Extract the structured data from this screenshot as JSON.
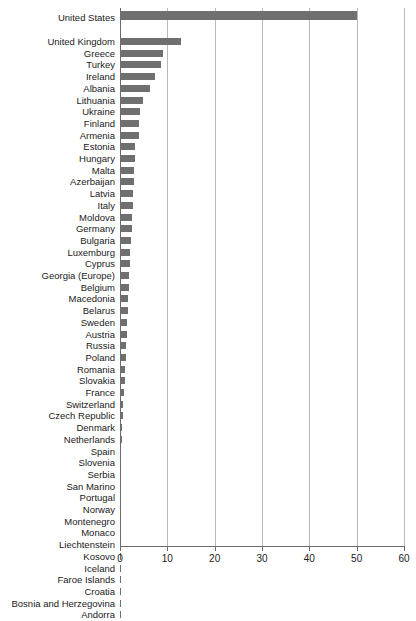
{
  "chart_data": {
    "type": "bar",
    "orientation": "horizontal",
    "title": "",
    "subtitle": "",
    "xlabel": "",
    "ylabel": "",
    "xlim": [
      0,
      60
    ],
    "ylim": null,
    "grid": true,
    "grid_axis": "x",
    "legend": null,
    "legend_position": "none",
    "bar_color": "#6f6f6f",
    "axis_color": "#6b6b6b",
    "grid_color": "#b9b9b9",
    "background": "#ffffff",
    "xticks": [
      0,
      10,
      20,
      30,
      40,
      50,
      60
    ],
    "xtick_labels": [
      "0",
      "10",
      "20",
      "30",
      "40",
      "50",
      "60"
    ],
    "categories": [
      "United States",
      "United Kingdom",
      "Greece",
      "Turkey",
      "Ireland",
      "Albania",
      "Lithuania",
      "Ukraine",
      "Finland",
      "Armenia",
      "Estonia",
      "Hungary",
      "Malta",
      "Azerbaijan",
      "Latvia",
      "Italy",
      "Moldova",
      "Germany",
      "Bulgaria",
      "Luxemburg",
      "Cyprus",
      "Georgia (Europe)",
      "Belgium",
      "Macedonia",
      "Belarus",
      "Sweden",
      "Austria",
      "Russia",
      "Poland",
      "Romania",
      "Slovakia",
      "France",
      "Switzerland",
      "Czech Republic",
      "Denmark",
      "Netherlands",
      "Spain",
      "Slovenia",
      "Serbia",
      "San Marino",
      "Portugal",
      "Norway",
      "Montenegro",
      "Monaco",
      "Liechtenstein",
      "Kosovo",
      "Iceland",
      "Faroe Islands",
      "Croatia",
      "Bosnia and Herzegovina",
      "Andorra"
    ],
    "values": [
      50.0,
      12.8,
      9.0,
      8.7,
      7.3,
      6.3,
      4.8,
      4.2,
      4.1,
      4.0,
      3.2,
      3.1,
      3.0,
      2.9,
      2.8,
      2.7,
      2.6,
      2.5,
      2.4,
      2.2,
      2.1,
      2.0,
      1.9,
      1.7,
      1.6,
      1.5,
      1.4,
      1.3,
      1.2,
      1.1,
      1.0,
      0.9,
      0.7,
      0.6,
      0.5,
      0.4,
      0.3,
      0.3,
      0.25,
      0.2,
      0.2,
      0.18,
      0.15,
      0.12,
      0.12,
      0.1,
      0.1,
      0.08,
      0.06,
      0.05,
      0.03
    ]
  }
}
